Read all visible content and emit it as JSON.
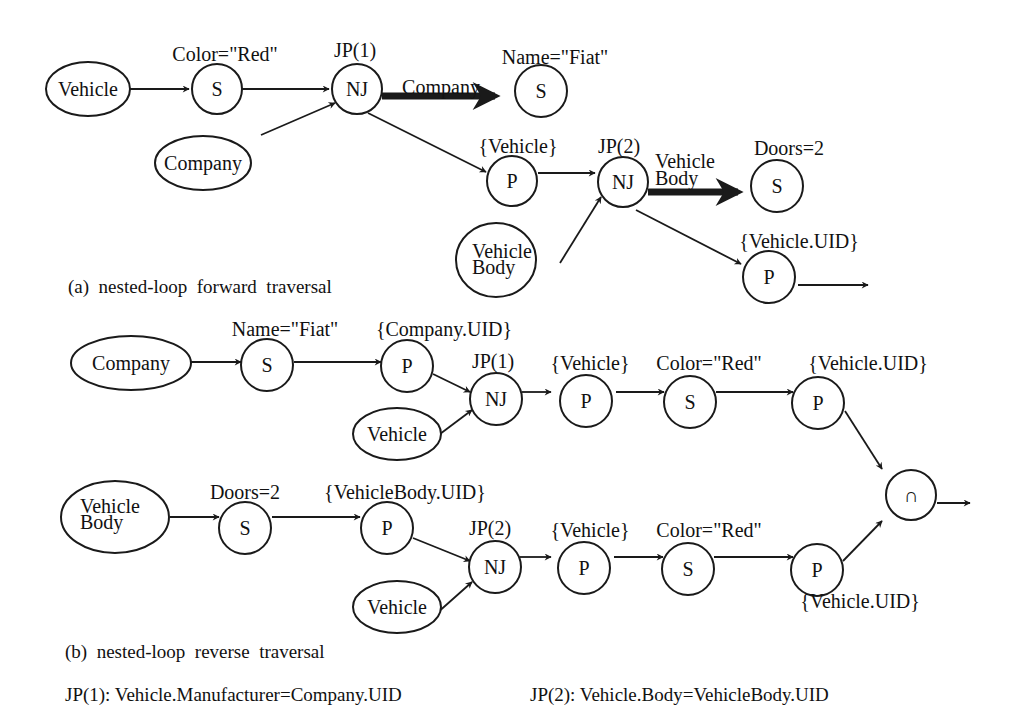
{
  "figure": {
    "part_a": {
      "caption": "(a)  nested-loop  forward  traversal",
      "nodes": {
        "vehicle": "Vehicle",
        "company": "Company",
        "s1": "S",
        "s1_label": "Color=\"Red\"",
        "nj1": "NJ",
        "nj1_label": "JP(1)",
        "s2": "S",
        "s2_label": "Name=\"Fiat\"",
        "edge_company": "Company",
        "p1": "P",
        "p1_label": "{Vehicle}",
        "nj2": "NJ",
        "nj2_label": "JP(2)",
        "vbody_1": "Vehicle",
        "vbody_2": "Body",
        "edge_vbody_1": "Vehicle",
        "edge_vbody_2": "Body",
        "s3": "S",
        "s3_label": "Doors=2",
        "p2": "P",
        "p2_label": "{Vehicle.UID}"
      }
    },
    "part_b": {
      "caption": "(b)  nested-loop  reverse  traversal",
      "top": {
        "company": "Company",
        "s1": "S",
        "s1_label": "Name=\"Fiat\"",
        "p1": "P",
        "p1_label": "{Company.UID}",
        "nj": "NJ",
        "nj_label": "JP(1)",
        "vehicle": "Vehicle",
        "p2": "P",
        "p2_label": "{Vehicle}",
        "s2": "S",
        "s2_label": "Color=\"Red\"",
        "p3": "P",
        "p3_label": "{Vehicle.UID}"
      },
      "intersect": "∩",
      "bottom": {
        "vbody_1": "Vehicle",
        "vbody_2": "Body",
        "s1": "S",
        "s1_label": "Doors=2",
        "p1": "P",
        "p1_label": "{VehicleBody.UID}",
        "nj": "NJ",
        "nj_label": "JP(2)",
        "vehicle": "Vehicle",
        "p2": "P",
        "p2_label": "{Vehicle}",
        "s2": "S",
        "s2_label": "Color=\"Red\"",
        "p3": "P",
        "p3_label": "{Vehicle.UID}"
      }
    },
    "footnotes": {
      "jp1": "JP(1): Vehicle.Manufacturer=Company.UID",
      "jp2": "JP(2): Vehicle.Body=VehicleBody.UID"
    }
  }
}
